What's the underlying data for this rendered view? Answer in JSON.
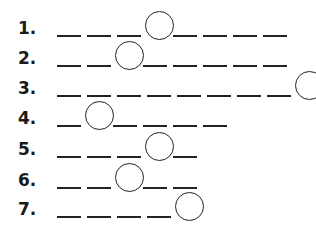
{
  "puzzle": {
    "rows": [
      {
        "label": "1.",
        "blanks": 8,
        "circle_index": 3
      },
      {
        "label": "2.",
        "blanks": 8,
        "circle_index": 2
      },
      {
        "label": "3.",
        "blanks": 9,
        "circle_index": 8
      },
      {
        "label": "4.",
        "blanks": 6,
        "circle_index": 1
      },
      {
        "label": "5.",
        "blanks": 5,
        "circle_index": 3
      },
      {
        "label": "6.",
        "blanks": 5,
        "circle_index": 2
      },
      {
        "label": "7.",
        "blanks": 5,
        "circle_index": 4
      }
    ]
  }
}
